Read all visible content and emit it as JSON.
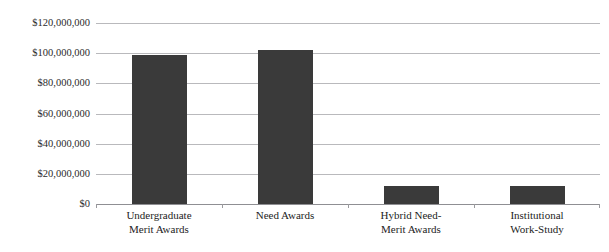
{
  "chart_data": {
    "type": "bar",
    "title": "",
    "xlabel": "",
    "ylabel": "",
    "categories": [
      "Undergraduate\nMerit Awards",
      "Need Awards",
      "Hybrid Need-\nMerit Awards",
      "Institutional\nWork-Study"
    ],
    "values": [
      99000000,
      102000000,
      12000000,
      12000000
    ],
    "ylim": [
      0,
      120000000
    ],
    "ytick_values": [
      0,
      20000000,
      40000000,
      60000000,
      80000000,
      100000000,
      120000000
    ],
    "ytick_labels": [
      "$0",
      "$20,000,000",
      "$40,000,000",
      "$60,000,000",
      "$80,000,000",
      "$100,000,000",
      "$120,000,000"
    ],
    "grid": true,
    "legend": "none",
    "bar_color": "#3a3a3a",
    "gridline_color": "#b9b9bc",
    "axis_color": "#8f8f93",
    "background_color": "#ffffff"
  }
}
